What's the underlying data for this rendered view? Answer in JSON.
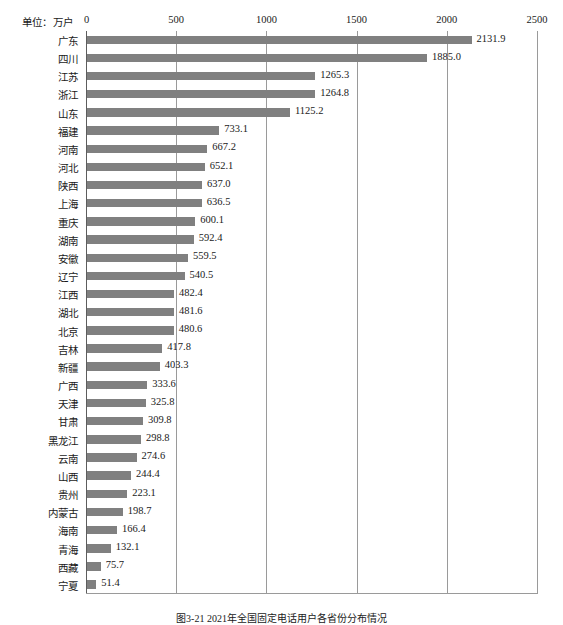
{
  "unit_label": "单位：万户",
  "figure_caption": "图3-21  2021年全国固定电话用户各省份分布情况",
  "colors": {
    "bar": "#808080",
    "gridline": "#9a9a9a",
    "axis": "#5d5d5d",
    "text": "#1a1a1a"
  },
  "chart_data": {
    "type": "bar",
    "orientation": "horizontal",
    "title": "",
    "subtitle": "",
    "xlabel": "单位：万户",
    "ylabel": "",
    "xlim": [
      0,
      2500
    ],
    "tick_labels": [
      "0",
      "500",
      "1000",
      "1500",
      "2000",
      "2500"
    ],
    "tick_values": [
      0,
      500,
      1000,
      1500,
      2000,
      2500
    ],
    "grid": true,
    "legend": false,
    "legend_position": "none",
    "categories": [
      "广东",
      "四川",
      "江苏",
      "浙江",
      "山东",
      "福建",
      "河南",
      "河北",
      "陕西",
      "上海",
      "重庆",
      "湖南",
      "安徽",
      "辽宁",
      "江西",
      "湖北",
      "北京",
      "吉林",
      "新疆",
      "广西",
      "天津",
      "甘肃",
      "黑龙江",
      "云南",
      "山西",
      "贵州",
      "内蒙古",
      "海南",
      "青海",
      "西藏",
      "宁夏"
    ],
    "values": [
      2131.9,
      1885.0,
      1265.3,
      1264.8,
      1125.2,
      733.1,
      667.2,
      652.1,
      637.0,
      636.5,
      600.1,
      592.4,
      559.5,
      540.5,
      482.4,
      481.6,
      480.6,
      417.8,
      403.3,
      333.6,
      325.8,
      309.8,
      298.8,
      274.6,
      244.4,
      223.1,
      198.7,
      166.4,
      132.1,
      75.7,
      51.4
    ],
    "value_labels": [
      "2131.9",
      "1885.0",
      "1265.3",
      "1264.8",
      "1125.2",
      "733.1",
      "667.2",
      "652.1",
      "637.0",
      "636.5",
      "600.1",
      "592.4",
      "559.5",
      "540.5",
      "482.4",
      "481.6",
      "480.6",
      "417.8",
      "403.3",
      "333.6",
      "325.8",
      "309.8",
      "298.8",
      "274.6",
      "244.4",
      "223.1",
      "198.7",
      "166.4",
      "132.1",
      "75.7",
      "51.4"
    ]
  }
}
